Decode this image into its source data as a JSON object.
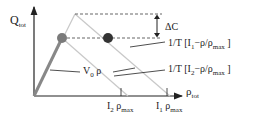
{
  "axes": {
    "y_label": "Q",
    "y_label_sub": "tot",
    "x_label": "ρ",
    "x_label_sub": "tot"
  },
  "annotations": {
    "delta": "ΔC",
    "line1_prefix": "1/T [I",
    "line1_sub": "1",
    "line1_suffix": "−ρ/ρ",
    "line1_sub2": "max",
    "line1_close": " ]",
    "line2_prefix": "1/T [I",
    "line2_sub": "2",
    "line2_suffix": "−ρ/ρ",
    "line2_sub2": "max",
    "line2_close": " ]",
    "free_flow": "V",
    "free_flow_sub": "0",
    "free_flow_suffix": " ρ"
  },
  "ticks": {
    "tick2_prefix": "I",
    "tick2_sub": "2",
    "tick2_rho": " ρ",
    "tick2_sub2": "max",
    "tick1_prefix": "I",
    "tick1_sub": "1",
    "tick1_rho": " ρ",
    "tick1_sub2": "max"
  },
  "colors": {
    "axis": "#222222",
    "thick_line": "#888888",
    "thin_line": "#c8c8c8",
    "dot_light": "#7a7a7a",
    "dot_dark": "#333333",
    "dashed": "#555555"
  }
}
